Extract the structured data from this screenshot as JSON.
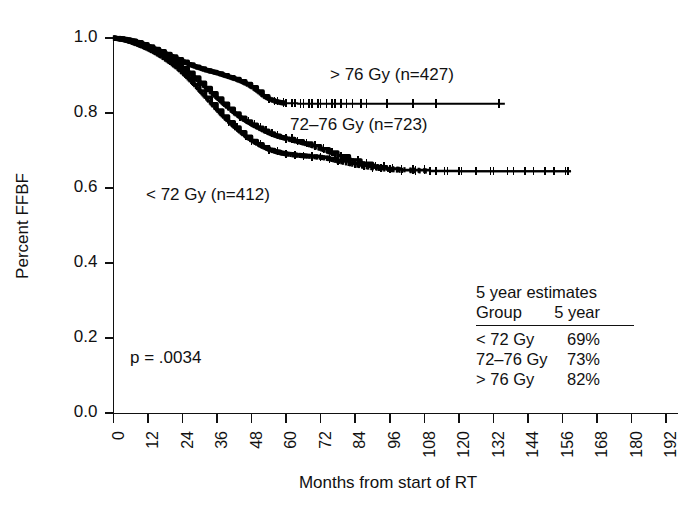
{
  "chart_data": {
    "type": "line",
    "subtype": "kaplan-meier-survival",
    "title": "",
    "xlabel": "Months from start of RT",
    "ylabel": "Percent FFBF",
    "xlim": [
      0,
      192
    ],
    "ylim": [
      0.0,
      1.0
    ],
    "grid": false,
    "legend_position": "inline-annotations",
    "xticks": [
      0,
      12,
      24,
      36,
      48,
      60,
      72,
      84,
      96,
      108,
      120,
      132,
      144,
      156,
      168,
      180,
      192
    ],
    "xtick_labels": [
      "0",
      "12",
      "24",
      "36",
      "48",
      "60",
      "72",
      "84",
      "96",
      "108",
      "120",
      "132",
      "144",
      "156",
      "168",
      "180",
      "192"
    ],
    "yticks": [
      0.0,
      0.2,
      0.4,
      0.6,
      0.8,
      1.0
    ],
    "ytick_labels": [
      "0.0",
      "0.2",
      "0.4",
      "0.6",
      "0.8",
      "1.0"
    ],
    "annotations": [
      {
        "name": "p-value",
        "text": "p = .0034",
        "x_months": 12,
        "y_value": 0.105
      },
      {
        "name": "label-gt76",
        "text": "> 76 Gy (n=427)",
        "x_months": 70,
        "y_value": 0.885
      },
      {
        "name": "label-72-76",
        "text": "72–76 Gy (n=723)",
        "x_months": 55,
        "y_value": 0.765
      },
      {
        "name": "label-lt72",
        "text": "< 72 Gy (n=412)",
        "x_months": 9,
        "y_value": 0.615
      }
    ],
    "series": [
      {
        "name": "> 76 Gy",
        "label": "> 76 Gy (n=427)",
        "n": 427,
        "color": "#000000",
        "five_year_estimate": "82%",
        "x": [
          0,
          2,
          4,
          6,
          8,
          10,
          12,
          14,
          16,
          18,
          20,
          22,
          24,
          26,
          28,
          30,
          32,
          34,
          36,
          38,
          40,
          42,
          44,
          46,
          48,
          50,
          52,
          54,
          56,
          58,
          60,
          64,
          70,
          76,
          84,
          92,
          100,
          110,
          120,
          130,
          136
        ],
        "y": [
          1.0,
          0.999,
          0.997,
          0.994,
          0.99,
          0.985,
          0.979,
          0.972,
          0.966,
          0.959,
          0.952,
          0.945,
          0.938,
          0.931,
          0.925,
          0.92,
          0.915,
          0.911,
          0.907,
          0.902,
          0.897,
          0.892,
          0.886,
          0.879,
          0.87,
          0.859,
          0.846,
          0.838,
          0.832,
          0.828,
          0.826,
          0.825,
          0.825,
          0.825,
          0.825,
          0.825,
          0.825,
          0.825,
          0.825,
          0.825,
          0.825
        ],
        "censor_months": [
          54,
          56,
          57,
          59,
          60,
          62,
          63,
          65,
          66,
          68,
          69,
          71,
          72,
          74,
          76,
          77,
          79,
          81,
          83,
          86,
          88,
          95,
          104,
          112,
          134
        ]
      },
      {
        "name": "72–76 Gy",
        "label": "72–76 Gy (n=723)",
        "n": 723,
        "color": "#000000",
        "five_year_estimate": "73%",
        "x": [
          0,
          2,
          4,
          6,
          8,
          10,
          12,
          14,
          16,
          18,
          20,
          22,
          24,
          26,
          28,
          30,
          32,
          34,
          36,
          38,
          40,
          42,
          44,
          46,
          48,
          50,
          52,
          54,
          56,
          58,
          60,
          63,
          66,
          69,
          72,
          75,
          78,
          82,
          86,
          90,
          95,
          100,
          110,
          120,
          130,
          140,
          150,
          159
        ],
        "y": [
          1.0,
          0.998,
          0.995,
          0.991,
          0.986,
          0.98,
          0.974,
          0.967,
          0.959,
          0.951,
          0.942,
          0.932,
          0.921,
          0.909,
          0.896,
          0.882,
          0.868,
          0.854,
          0.84,
          0.826,
          0.813,
          0.8,
          0.789,
          0.779,
          0.77,
          0.762,
          0.754,
          0.747,
          0.741,
          0.736,
          0.732,
          0.726,
          0.72,
          0.713,
          0.705,
          0.696,
          0.686,
          0.675,
          0.666,
          0.659,
          0.653,
          0.649,
          0.646,
          0.645,
          0.645,
          0.645,
          0.645,
          0.645
        ],
        "censor_months": [
          44,
          47,
          49,
          51,
          53,
          55,
          57,
          60,
          62,
          64,
          67,
          70,
          73,
          76,
          79,
          82,
          85,
          88,
          91,
          94,
          97,
          100,
          104,
          108,
          112,
          116,
          121,
          126,
          131,
          137,
          143,
          150,
          157
        ]
      },
      {
        "name": "< 72 Gy",
        "label": "< 72 Gy (n=412)",
        "n": 412,
        "color": "#000000",
        "five_year_estimate": "69%",
        "x": [
          0,
          2,
          4,
          6,
          8,
          10,
          12,
          14,
          16,
          18,
          20,
          22,
          24,
          26,
          28,
          30,
          32,
          34,
          36,
          38,
          40,
          42,
          44,
          46,
          48,
          50,
          52,
          54,
          56,
          58,
          60,
          63,
          66,
          69,
          72,
          75,
          78,
          82,
          86,
          90,
          95,
          100,
          110,
          120,
          130,
          140,
          150,
          159
        ],
        "y": [
          1.0,
          0.998,
          0.995,
          0.99,
          0.984,
          0.978,
          0.971,
          0.963,
          0.954,
          0.944,
          0.933,
          0.921,
          0.907,
          0.892,
          0.876,
          0.859,
          0.842,
          0.825,
          0.808,
          0.792,
          0.777,
          0.763,
          0.75,
          0.738,
          0.727,
          0.718,
          0.71,
          0.703,
          0.698,
          0.694,
          0.691,
          0.688,
          0.686,
          0.684,
          0.682,
          0.678,
          0.672,
          0.665,
          0.659,
          0.654,
          0.65,
          0.647,
          0.645,
          0.645,
          0.645,
          0.645,
          0.645,
          0.645
        ],
        "censor_months": [
          40,
          43,
          46,
          48,
          51,
          54,
          57,
          60,
          63,
          66,
          69,
          72,
          75,
          78,
          81,
          84,
          87,
          90,
          93,
          96,
          100,
          105,
          110,
          115,
          120,
          126,
          132,
          139,
          146,
          153,
          158
        ]
      }
    ]
  },
  "estimates_table": {
    "title": "5 year estimates",
    "headers": [
      "Group",
      "5 year"
    ],
    "rows": [
      {
        "group": "< 72 Gy",
        "five_year": "69%"
      },
      {
        "group": "72–76 Gy",
        "five_year": "73%"
      },
      {
        "group": "> 76 Gy",
        "five_year": "82%"
      }
    ]
  },
  "statistics": {
    "p_label": "p = .0034",
    "p_value": 0.0034
  },
  "axes": {
    "x_title": "Months from start of RT",
    "y_title": "Percent FFBF"
  }
}
